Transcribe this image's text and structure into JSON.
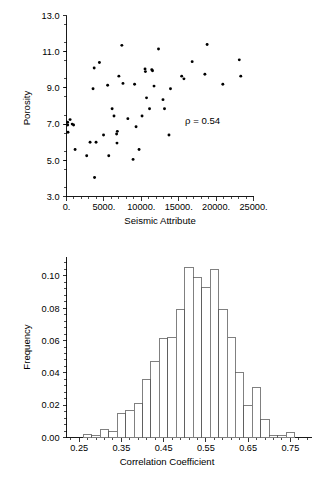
{
  "page": {
    "background": "#ffffff",
    "width": 326,
    "height": 490,
    "foreground": "#000000"
  },
  "scatter_panel": {
    "name": "porosity-vs-seismic-attribute-scatter",
    "ylabel": "Porosity",
    "xlabel": "Seismic Attribute",
    "annotation": "ρ = 0.54",
    "yticklabels": [
      "13.0",
      "11.0",
      "9.0",
      "7.0",
      "5.0",
      "3.0"
    ],
    "xticklabels": [
      "0.",
      "5000.",
      "10000.",
      "15000.",
      "20000.",
      "25000."
    ]
  },
  "histogram_panel": {
    "name": "correlation-coefficient-histogram",
    "ylabel": "Frequency",
    "xlabel": "Correlation Coefficient",
    "yticklabels": [
      "0.10",
      "0.08",
      "0.06",
      "0.04",
      "0.02",
      "0.00"
    ],
    "xticklabels": [
      "0.25",
      "0.35",
      "0.45",
      "0.55",
      "0.65",
      "0.75"
    ]
  },
  "chart_data": [
    {
      "type": "scatter",
      "title": "",
      "xlabel": "Seismic Attribute",
      "ylabel": "Porosity",
      "xlim": [
        0,
        25000
      ],
      "ylim": [
        3.0,
        13.0
      ],
      "xticks": [
        0,
        5000,
        10000,
        15000,
        20000,
        25000
      ],
      "yticks": [
        3.0,
        5.0,
        7.0,
        9.0,
        11.0,
        13.0
      ],
      "grid": false,
      "legend": "none",
      "annotations": [
        {
          "text": "ρ = 0.54",
          "x": 18000,
          "y": 7.0
        }
      ],
      "marker": "filled-circle",
      "marker_color": "#000000",
      "points": [
        {
          "x": 150,
          "y": 7.1
        },
        {
          "x": 160,
          "y": 6.95
        },
        {
          "x": 200,
          "y": 6.55
        },
        {
          "x": 480,
          "y": 7.25
        },
        {
          "x": 760,
          "y": 7.0
        },
        {
          "x": 950,
          "y": 6.95
        },
        {
          "x": 1150,
          "y": 5.6
        },
        {
          "x": 2700,
          "y": 5.25
        },
        {
          "x": 3150,
          "y": 6.0
        },
        {
          "x": 3550,
          "y": 8.95
        },
        {
          "x": 3700,
          "y": 10.1
        },
        {
          "x": 3750,
          "y": 4.05
        },
        {
          "x": 3950,
          "y": 6.0
        },
        {
          "x": 4400,
          "y": 10.4
        },
        {
          "x": 4950,
          "y": 6.4
        },
        {
          "x": 5500,
          "y": 9.15
        },
        {
          "x": 5650,
          "y": 5.25
        },
        {
          "x": 6100,
          "y": 7.85
        },
        {
          "x": 6350,
          "y": 7.45
        },
        {
          "x": 6700,
          "y": 6.45
        },
        {
          "x": 6750,
          "y": 5.95
        },
        {
          "x": 6800,
          "y": 6.6
        },
        {
          "x": 7000,
          "y": 9.65
        },
        {
          "x": 7400,
          "y": 11.35
        },
        {
          "x": 7550,
          "y": 9.25
        },
        {
          "x": 8200,
          "y": 7.3
        },
        {
          "x": 8900,
          "y": 5.05
        },
        {
          "x": 9100,
          "y": 9.2
        },
        {
          "x": 9300,
          "y": 6.85
        },
        {
          "x": 9700,
          "y": 5.6
        },
        {
          "x": 10100,
          "y": 7.45
        },
        {
          "x": 10500,
          "y": 10.05
        },
        {
          "x": 10550,
          "y": 9.9
        },
        {
          "x": 10700,
          "y": 8.45
        },
        {
          "x": 11100,
          "y": 7.85
        },
        {
          "x": 11400,
          "y": 10.0
        },
        {
          "x": 11500,
          "y": 9.95
        },
        {
          "x": 11700,
          "y": 9.1
        },
        {
          "x": 12300,
          "y": 11.15
        },
        {
          "x": 12900,
          "y": 8.35
        },
        {
          "x": 13100,
          "y": 7.85
        },
        {
          "x": 13700,
          "y": 6.4
        },
        {
          "x": 13900,
          "y": 8.95
        },
        {
          "x": 15400,
          "y": 9.65
        },
        {
          "x": 15700,
          "y": 9.5
        },
        {
          "x": 16800,
          "y": 10.45
        },
        {
          "x": 18500,
          "y": 9.75
        },
        {
          "x": 18800,
          "y": 11.4
        },
        {
          "x": 20900,
          "y": 9.2
        },
        {
          "x": 23100,
          "y": 10.55
        },
        {
          "x": 23300,
          "y": 9.65
        }
      ]
    },
    {
      "type": "bar",
      "subtype": "histogram",
      "title": "",
      "xlabel": "Correlation Coefficient",
      "ylabel": "Frequency",
      "xlim": [
        0.22,
        0.8
      ],
      "ylim": [
        0.0,
        0.112
      ],
      "xticks": [
        0.25,
        0.35,
        0.45,
        0.55,
        0.65,
        0.75
      ],
      "yticks": [
        0.0,
        0.02,
        0.04,
        0.06,
        0.08,
        0.1
      ],
      "grid": false,
      "legend": "none",
      "bin_width": 0.02,
      "bin_edges": [
        0.24,
        0.26,
        0.28,
        0.3,
        0.32,
        0.34,
        0.36,
        0.38,
        0.4,
        0.42,
        0.44,
        0.46,
        0.48,
        0.5,
        0.52,
        0.54,
        0.56,
        0.58,
        0.6,
        0.62,
        0.64,
        0.66,
        0.68,
        0.7,
        0.72,
        0.74,
        0.76,
        0.78
      ],
      "categories": [
        "0.24-0.26",
        "0.26-0.28",
        "0.28-0.30",
        "0.30-0.32",
        "0.32-0.34",
        "0.34-0.36",
        "0.36-0.38",
        "0.38-0.40",
        "0.40-0.42",
        "0.42-0.44",
        "0.44-0.46",
        "0.46-0.48",
        "0.48-0.50",
        "0.50-0.52",
        "0.52-0.54",
        "0.54-0.56",
        "0.56-0.58",
        "0.58-0.60",
        "0.60-0.62",
        "0.62-0.64",
        "0.64-0.66",
        "0.66-0.68",
        "0.68-0.70",
        "0.70-0.72",
        "0.72-0.74",
        "0.74-0.76",
        "0.76-0.78"
      ],
      "values": [
        0.0,
        0.002,
        0.001,
        0.005,
        0.004,
        0.015,
        0.017,
        0.021,
        0.036,
        0.047,
        0.061,
        0.062,
        0.079,
        0.105,
        0.099,
        0.093,
        0.104,
        0.079,
        0.062,
        0.04,
        0.02,
        0.031,
        0.011,
        0.001,
        0.001,
        0.003,
        0.0
      ]
    }
  ]
}
